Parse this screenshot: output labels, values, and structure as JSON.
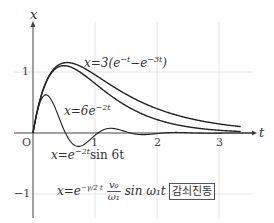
{
  "chart_data": {
    "type": "line",
    "title": "",
    "xlabel": "t",
    "ylabel": "x",
    "origin_label": "O",
    "xlim": [
      -0.3,
      3.6
    ],
    "ylim": [
      -1.4,
      1.75
    ],
    "x_ticks": [
      {
        "value": 1,
        "label": "1"
      },
      {
        "value": 2,
        "label": "2"
      },
      {
        "value": 3,
        "label": "3"
      }
    ],
    "y_ticks": [
      {
        "value": 1,
        "label": "1"
      },
      {
        "value": -1,
        "label": "−1"
      }
    ],
    "grid": true,
    "series": [
      {
        "name": "x=3(e^{-t} - e^{-3t})",
        "formula": "3*(exp(-t)-exp(-3t))",
        "t_range": [
          0,
          3.35
        ]
      },
      {
        "name": "x=6te^{-2t}",
        "formula": "6*t*exp(-2t)",
        "t_range": [
          0,
          3.35
        ]
      },
      {
        "name": "x=e^{-2t} sin 6t",
        "formula": "exp(-2t)*sin(6t)",
        "t_range": [
          0,
          3.55
        ]
      }
    ],
    "annotations": [
      "x=3(e^{-t}-e^{-3t})",
      "x=6e^{-2t}",
      "x=e^{-2t} sin 6t",
      "x=e^{-γ/2 t} (v0/ω1) sin ω1 t",
      "감쇠진동"
    ]
  },
  "labels": {
    "x_axis": "t",
    "y_axis": "x",
    "origin": "O",
    "tick_1": "1",
    "tick_2": "2",
    "tick_3": "3",
    "ytick_1": "1",
    "ytick_m1": "−1",
    "eq1_lhs": "x=3(e",
    "eq1_exp1": "−t",
    "eq1_mid": "−e",
    "eq1_exp2": "−3t",
    "eq1_rhs": ")",
    "eq2_lhs": "x=6e",
    "eq2_exp": "−2t",
    "eq3_lhs": "x=e",
    "eq3_exp": "−2t",
    "eq3_rhs": "sin 6t",
    "eq4_lhs": "x=e",
    "eq4_exp": "−γ/2 t",
    "eq4_num": "v₀",
    "eq4_den": "ω₁",
    "eq4_rhs": "sin ω₁t",
    "tag": "감쇠진동"
  },
  "colors": {
    "curve": "#222222",
    "axis": "#444444",
    "grid": "#e4e4e4"
  }
}
